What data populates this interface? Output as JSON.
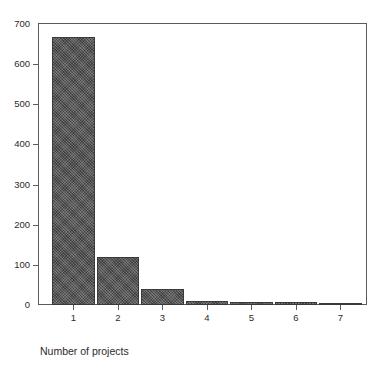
{
  "figure": {
    "clipped_title": "",
    "background_color": "#ffffff",
    "frame_color": "#5b5b5b",
    "bar_color": "#4d4d4d"
  },
  "chart_data": {
    "type": "bar",
    "title": "",
    "xlabel": "Number of projects",
    "ylabel": "",
    "categories": [
      "1",
      "2",
      "3",
      "4",
      "5",
      "6",
      "7"
    ],
    "values": [
      668,
      120,
      40,
      10,
      8,
      8,
      2
    ],
    "ylim": [
      0,
      700
    ],
    "yticks": [
      0,
      100,
      200,
      300,
      400,
      500,
      600,
      700
    ],
    "ytick_labels": [
      "0",
      "100",
      "200",
      "300",
      "400",
      "500",
      "600",
      "700"
    ],
    "grid": false,
    "legend": false,
    "legend_position": "none"
  }
}
